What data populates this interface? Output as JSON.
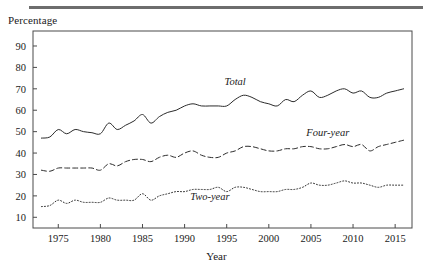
{
  "figure": {
    "y_axis_title": "Percentage",
    "x_axis_title": "Year"
  },
  "chart_data": {
    "type": "line",
    "title": "",
    "xlabel": "Year",
    "ylabel": "Percentage",
    "xlim": [
      1972,
      2017
    ],
    "ylim": [
      5,
      97
    ],
    "grid": false,
    "legend": "inline-labels",
    "xticks": [
      1975,
      1980,
      1985,
      1990,
      1995,
      2000,
      2005,
      2010,
      2015
    ],
    "yticks": [
      10,
      20,
      30,
      40,
      50,
      60,
      70,
      80,
      90
    ],
    "x": [
      1973,
      1974,
      1975,
      1976,
      1977,
      1978,
      1979,
      1980,
      1981,
      1982,
      1983,
      1984,
      1985,
      1986,
      1987,
      1988,
      1989,
      1990,
      1991,
      1992,
      1993,
      1994,
      1995,
      1996,
      1997,
      1998,
      1999,
      2000,
      2001,
      2002,
      2003,
      2004,
      2005,
      2006,
      2007,
      2008,
      2009,
      2010,
      2011,
      2012,
      2013,
      2014,
      2015,
      2016
    ],
    "series": [
      {
        "name": "Total",
        "style": "solid",
        "label": "Total",
        "label_x": 1996,
        "label_y": 72,
        "values": [
          47,
          47.5,
          51,
          49,
          51,
          50,
          49.5,
          49,
          54,
          51,
          53,
          55,
          58,
          54,
          57,
          59,
          60,
          62,
          63,
          62,
          62,
          62,
          62,
          65,
          67,
          66,
          64,
          63,
          62,
          65,
          64,
          67,
          69,
          66,
          67,
          69,
          70,
          68,
          69,
          66,
          66,
          68,
          69,
          70
        ]
      },
      {
        "name": "Four-year",
        "style": "dashed",
        "label": "Four-year",
        "label_x": 2007,
        "label_y": 48,
        "values": [
          32,
          31.5,
          33,
          33,
          33,
          33,
          33,
          32,
          35,
          34,
          36,
          37,
          37,
          36,
          38,
          39,
          38,
          40,
          41,
          39,
          38,
          38,
          40,
          41,
          43,
          43,
          42,
          41,
          41,
          42,
          42,
          43,
          43,
          42,
          42,
          43,
          44,
          43,
          44,
          41,
          43,
          44,
          45,
          46
        ]
      },
      {
        "name": "Two-year",
        "style": "dotted",
        "label": "Two-year",
        "label_x": 1993,
        "label_y": 18,
        "values": [
          15,
          15.5,
          18,
          16.5,
          18,
          17,
          17,
          17,
          19,
          18,
          18,
          18,
          21,
          18,
          20,
          21,
          22,
          22,
          23,
          23,
          23,
          24,
          22,
          24,
          24,
          23,
          22,
          22,
          22,
          23,
          23,
          24,
          26,
          25,
          25,
          26,
          27,
          26,
          26,
          25,
          24,
          25,
          25,
          25
        ]
      }
    ]
  }
}
